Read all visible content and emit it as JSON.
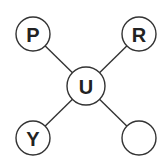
{
  "diagram": {
    "type": "star",
    "center": {
      "id": "center",
      "label": "U",
      "x": 86,
      "y": 86,
      "r": 19
    },
    "nodes": [
      {
        "id": "top-left",
        "label": "P",
        "x": 33,
        "y": 34,
        "r": 17
      },
      {
        "id": "top-right",
        "label": "R",
        "x": 139,
        "y": 34,
        "r": 17
      },
      {
        "id": "bottom-left",
        "label": "Y",
        "x": 33,
        "y": 138,
        "r": 17
      },
      {
        "id": "bottom-right",
        "label": "",
        "x": 139,
        "y": 138,
        "r": 17
      }
    ],
    "colors": {
      "stroke": "#333333",
      "text": "#222222",
      "background": "#ffffff"
    }
  }
}
